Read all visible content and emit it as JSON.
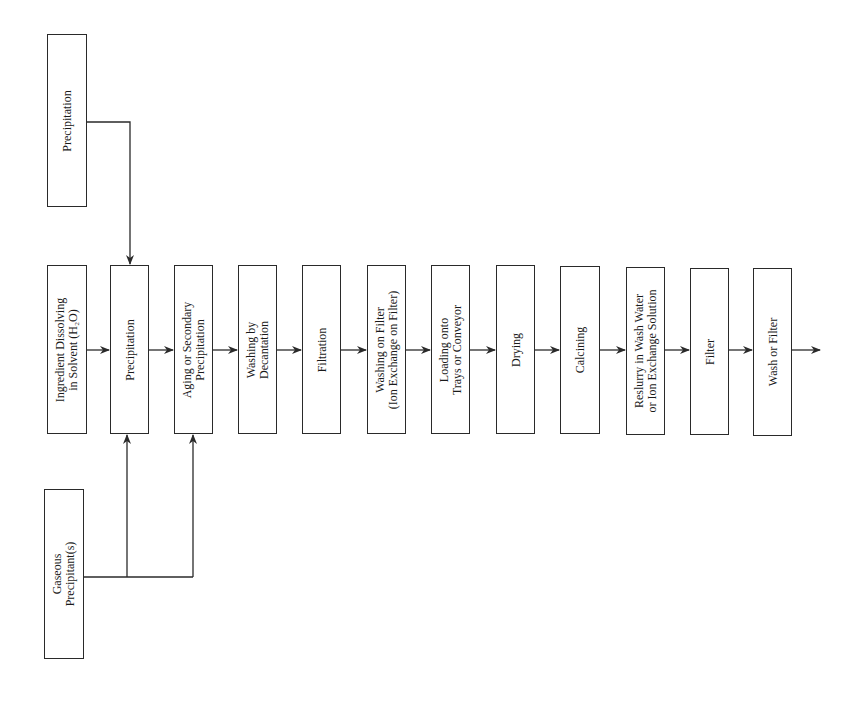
{
  "diagram": {
    "type": "process-flowchart",
    "orientation": "rotated-90-ccw",
    "side_inputs": [
      {
        "id": "precip-input",
        "label": [
          "Precipitation"
        ],
        "x": 47,
        "y": 34,
        "w": 40,
        "h": 173
      },
      {
        "id": "gas-input",
        "label": [
          "Gaseous",
          "Precipitant(s)"
        ],
        "x": 44,
        "y": 489,
        "w": 40,
        "h": 170
      }
    ],
    "steps": [
      {
        "id": "s1",
        "label": [
          "Ingredient Dissolving",
          "in Solvent (H₂O)"
        ],
        "x": 47,
        "y": 265,
        "w": 40,
        "h": 169
      },
      {
        "id": "s2",
        "label": [
          "Precipitation"
        ],
        "x": 110,
        "y": 265,
        "w": 39,
        "h": 169
      },
      {
        "id": "s3",
        "label": [
          "Aging or Secondary",
          "Precipitation"
        ],
        "x": 174,
        "y": 265,
        "w": 39,
        "h": 169
      },
      {
        "id": "s4",
        "label": [
          "Washing by",
          "Decantation"
        ],
        "x": 238,
        "y": 265,
        "w": 39,
        "h": 169
      },
      {
        "id": "s5",
        "label": [
          "Filtration"
        ],
        "x": 302,
        "y": 265,
        "w": 39,
        "h": 169
      },
      {
        "id": "s6",
        "label": [
          "Washing on Filter",
          "(Ion Exchange on Filter)"
        ],
        "x": 367,
        "y": 265,
        "w": 39,
        "h": 169
      },
      {
        "id": "s7",
        "label": [
          "Loading onto",
          "Trays or Conveyor"
        ],
        "x": 431,
        "y": 265,
        "w": 39,
        "h": 169
      },
      {
        "id": "s8",
        "label": [
          "Drying"
        ],
        "x": 496,
        "y": 265,
        "w": 39,
        "h": 169
      },
      {
        "id": "s9",
        "label": [
          "Calcining"
        ],
        "x": 560,
        "y": 266,
        "w": 40,
        "h": 168
      },
      {
        "id": "s10",
        "label": [
          "Reslurry in Wash Water",
          "or Ion Exchange Solution"
        ],
        "x": 626,
        "y": 267,
        "w": 39,
        "h": 168
      },
      {
        "id": "s11",
        "label": [
          "Filter"
        ],
        "x": 690,
        "y": 268,
        "w": 39,
        "h": 167
      },
      {
        "id": "s12",
        "label": [
          "Wash or Filter"
        ],
        "x": 753,
        "y": 268,
        "w": 39,
        "h": 168
      }
    ],
    "line_color": "#2a2a2a",
    "main_arrow_y": 350
  }
}
